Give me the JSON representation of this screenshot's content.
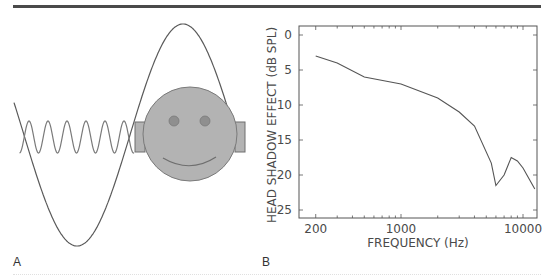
{
  "panels": {
    "a": {
      "label": "A",
      "illustration": {
        "face": {
          "fill": "#b3b3b3",
          "stroke": "#6e6e6e"
        },
        "low_frequency_wave": {
          "description": "long wavelength sine wave bending around the head",
          "color": "#5a5a5a"
        },
        "high_frequency_wave": {
          "description": "short wavelength sine wave blocked by the head",
          "color": "#7a7a7a",
          "cycles": 6
        }
      }
    },
    "b": {
      "label": "B"
    }
  },
  "chart_data": {
    "type": "line",
    "title": "",
    "xlabel": "FREQUENCY (Hz)",
    "ylabel": "HEAD SHADOW EFFECT (dB SPL)",
    "x_scale": "log",
    "y_inverted": true,
    "xlim": [
      170,
      13000
    ],
    "ylim": [
      0,
      26
    ],
    "x_ticks": [
      200,
      1000,
      10000
    ],
    "x_tick_labels": [
      "200",
      "1000",
      "10000"
    ],
    "y_ticks": [
      0,
      5,
      10,
      15,
      20,
      25
    ],
    "y_tick_labels": [
      "0",
      "5",
      "10",
      "15",
      "20",
      "25"
    ],
    "grid": false,
    "legend": null,
    "series": [
      {
        "name": "Head shadow effect",
        "color": "#555555",
        "x": [
          200,
          300,
          500,
          1000,
          2000,
          3000,
          4000,
          5500,
          6000,
          7000,
          8000,
          9000,
          10000,
          12500
        ],
        "y": [
          3,
          4,
          6,
          7,
          9,
          11,
          13,
          18.3,
          21.5,
          20,
          17.5,
          18,
          19,
          22
        ]
      }
    ]
  }
}
